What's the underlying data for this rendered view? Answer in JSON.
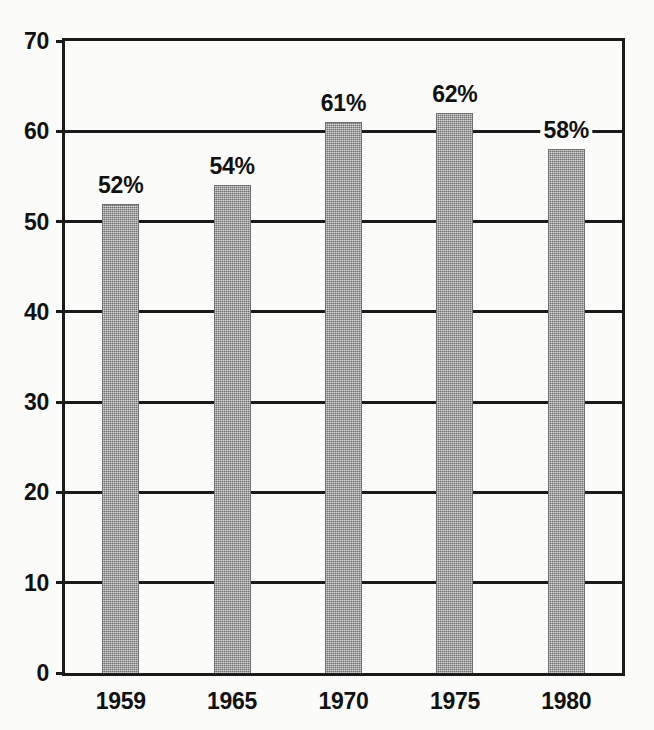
{
  "chart_data": {
    "type": "bar",
    "title": "",
    "subtitle": "",
    "xlabel": "",
    "ylabel": "",
    "categories": [
      "1959",
      "1965",
      "1970",
      "1975",
      "1980"
    ],
    "values": [
      52,
      54,
      61,
      62,
      58
    ],
    "value_labels": [
      "52%",
      "54%",
      "61%",
      "62%",
      "58%"
    ],
    "ylim": [
      0,
      70
    ],
    "ytick_labels": [
      "0",
      "10",
      "20",
      "30",
      "40",
      "50",
      "60",
      "70"
    ],
    "ytick_values": [
      0,
      10,
      20,
      30,
      40,
      50,
      60,
      70
    ],
    "grid": "horizontal",
    "legend": "none",
    "bar_color": "#9d9d9d",
    "axis_color": "#1a1a1a",
    "background_color": "#fbfbf9"
  }
}
